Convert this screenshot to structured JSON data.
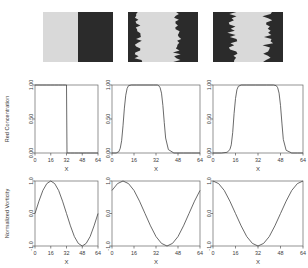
{
  "figure": {
    "title": "",
    "rows": 3,
    "columns": 3,
    "colors": {
      "light_phase": "#d9d9d9",
      "dark_phase": "#2b2b2b",
      "axis": "#555555",
      "curve": "#444444",
      "background": "#ffffff"
    }
  },
  "snapshots": {
    "row_label": "simulation snapshots",
    "panels": [
      {
        "name": "snapshot-panel-1",
        "description": "light phase left half, dark phase right half, flat vertical interface at x=32"
      },
      {
        "name": "snapshot-panel-2",
        "description": "dark phase at both edges, light band in centre with rough interfaces"
      },
      {
        "name": "snapshot-panel-3",
        "description": "dark phase at both edges, narrower light band, strongly corrugated interfaces"
      }
    ]
  },
  "chart_data": [
    {
      "type": "line",
      "name": "red-concentration-panel-1",
      "title": "",
      "xlabel": "X",
      "ylabel": "Red Concentration",
      "xlim": [
        0,
        64
      ],
      "ylim": [
        0.0,
        1.0
      ],
      "xticks": [
        0,
        16,
        32,
        48,
        64
      ],
      "xticklabels": [
        "0",
        "16",
        "32",
        "48",
        "64"
      ],
      "yticks": [
        0.0,
        0.5,
        1.0
      ],
      "yticklabels": [
        "0.00",
        "0.50",
        "1.00"
      ],
      "grid": false,
      "legend": null,
      "x": [
        0,
        4,
        8,
        12,
        16,
        20,
        24,
        28,
        31,
        31.5,
        32,
        32.5,
        33,
        36,
        40,
        44,
        48,
        52,
        56,
        60,
        64
      ],
      "y": [
        1.0,
        1.0,
        1.0,
        1.0,
        1.0,
        1.0,
        1.0,
        1.0,
        1.0,
        1.0,
        1.0,
        0.0,
        0.0,
        0.0,
        0.0,
        0.0,
        0.0,
        0.0,
        0.0,
        0.0,
        0.0
      ]
    },
    {
      "type": "line",
      "name": "red-concentration-panel-2",
      "title": "",
      "xlabel": "X",
      "ylabel": "Red Concentration",
      "xlim": [
        0,
        64
      ],
      "ylim": [
        0.0,
        1.0
      ],
      "xticks": [
        0,
        16,
        32,
        48,
        64
      ],
      "xticklabels": [
        "0",
        "16",
        "32",
        "48",
        "64"
      ],
      "yticks": [
        0.0,
        0.5,
        1.0
      ],
      "yticklabels": [
        "0.00",
        "0.50",
        "1.00"
      ],
      "grid": false,
      "legend": null,
      "x": [
        0,
        3,
        5,
        6,
        7,
        8,
        9,
        10,
        11,
        12,
        14,
        18,
        24,
        30,
        33,
        34,
        35,
        36,
        37,
        38,
        39,
        41,
        45,
        52,
        58,
        64
      ],
      "y": [
        0.0,
        0.0,
        0.02,
        0.07,
        0.18,
        0.4,
        0.66,
        0.85,
        0.95,
        0.99,
        1.0,
        1.0,
        1.0,
        1.0,
        1.0,
        0.99,
        0.96,
        0.88,
        0.7,
        0.45,
        0.22,
        0.05,
        0.0,
        0.0,
        0.0,
        0.0
      ]
    },
    {
      "type": "line",
      "name": "red-concentration-panel-3",
      "title": "",
      "xlabel": "X",
      "ylabel": "Red Concentration",
      "xlim": [
        0,
        64
      ],
      "ylim": [
        0.0,
        1.0
      ],
      "xticks": [
        0,
        16,
        32,
        48,
        64
      ],
      "xticklabels": [
        "0",
        "16",
        "32",
        "48",
        "64"
      ],
      "yticks": [
        0.0,
        0.5,
        1.0
      ],
      "yticklabels": [
        "0.00",
        "0.50",
        "1.00"
      ],
      "grid": false,
      "legend": null,
      "x": [
        0,
        6,
        10,
        12,
        13,
        14,
        15,
        16,
        17,
        18,
        20,
        24,
        30,
        38,
        43,
        45,
        46,
        47,
        48,
        49,
        50,
        52,
        56,
        60,
        64
      ],
      "y": [
        0.0,
        0.0,
        0.01,
        0.05,
        0.12,
        0.3,
        0.58,
        0.8,
        0.93,
        0.98,
        1.0,
        1.0,
        1.0,
        1.0,
        1.0,
        0.99,
        0.96,
        0.88,
        0.7,
        0.44,
        0.2,
        0.04,
        0.0,
        0.0,
        0.0
      ]
    },
    {
      "type": "line",
      "name": "normalized-vorticity-panel-1",
      "title": "",
      "xlabel": "X",
      "ylabel": "Normalized Vorticity",
      "xlim": [
        0,
        64
      ],
      "ylim": [
        -1.0,
        1.0
      ],
      "xticks": [
        0,
        16,
        32,
        48,
        64
      ],
      "xticklabels": [
        "0",
        "16",
        "32",
        "48",
        "64"
      ],
      "yticks": [
        -1.0,
        0.0,
        1.0
      ],
      "yticklabels": [
        "-1.0",
        "0.0",
        "1.0"
      ],
      "grid": false,
      "legend": null,
      "function": "sin(2*pi*x/64)",
      "x": [
        0,
        4,
        8,
        12,
        16,
        20,
        24,
        28,
        32,
        36,
        40,
        44,
        48,
        52,
        56,
        60,
        64
      ],
      "y": [
        0.0,
        0.38,
        0.71,
        0.92,
        1.0,
        0.92,
        0.71,
        0.38,
        0.0,
        -0.38,
        -0.71,
        -0.92,
        -1.0,
        -0.92,
        -0.71,
        -0.38,
        0.0
      ]
    },
    {
      "type": "line",
      "name": "normalized-vorticity-panel-2",
      "title": "",
      "xlabel": "X",
      "ylabel": "Normalized Vorticity",
      "xlim": [
        0,
        64
      ],
      "ylim": [
        -1.0,
        1.0
      ],
      "xticks": [
        0,
        16,
        32,
        48,
        64
      ],
      "xticklabels": [
        "0",
        "16",
        "32",
        "48",
        "64"
      ],
      "yticks": [
        -1.0,
        0.0,
        1.0
      ],
      "yticklabels": [
        "-1.0",
        "0.0",
        "1.0"
      ],
      "grid": false,
      "legend": null,
      "function": "sin(2*pi*(x+8)/64)",
      "x": [
        0,
        4,
        8,
        12,
        16,
        20,
        24,
        28,
        32,
        36,
        40,
        44,
        48,
        52,
        56,
        60,
        64
      ],
      "y": [
        0.71,
        0.92,
        1.0,
        0.92,
        0.71,
        0.38,
        0.0,
        -0.38,
        -0.71,
        -0.92,
        -1.0,
        -0.92,
        -0.71,
        -0.38,
        0.0,
        0.38,
        0.71
      ]
    },
    {
      "type": "line",
      "name": "normalized-vorticity-panel-3",
      "title": "",
      "xlabel": "X",
      "ylabel": "Normalized Vorticity",
      "xlim": [
        0,
        64
      ],
      "ylim": [
        -1.0,
        1.0
      ],
      "xticks": [
        0,
        16,
        32,
        48,
        64
      ],
      "xticklabels": [
        "0",
        "16",
        "32",
        "48",
        "64"
      ],
      "yticks": [
        -1.0,
        0.0,
        1.0
      ],
      "yticklabels": [
        "-1.0",
        "0.0",
        "1.0"
      ],
      "grid": false,
      "legend": null,
      "function": "cos(2*pi*(x-32)/64) inverted : -cos(2*pi*x/64)... minimum at x=32",
      "x": [
        0,
        4,
        8,
        12,
        16,
        20,
        24,
        28,
        32,
        36,
        40,
        44,
        48,
        52,
        56,
        60,
        64
      ],
      "y": [
        1.0,
        0.92,
        0.71,
        0.38,
        0.0,
        -0.38,
        -0.71,
        -0.92,
        -1.0,
        -0.92,
        -0.71,
        -0.38,
        0.0,
        0.38,
        0.71,
        0.92,
        1.0
      ]
    }
  ],
  "labels": {
    "x_axis": "X",
    "y_axis_concentration": "Red Concentration",
    "y_axis_vorticity": "Normalized Vorticity"
  }
}
